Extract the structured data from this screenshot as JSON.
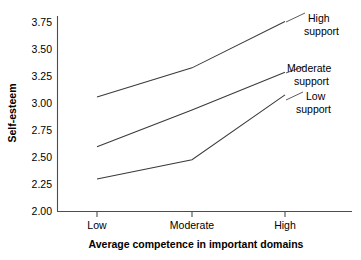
{
  "chart_data": {
    "type": "line",
    "title": "",
    "xlabel": "Average competence in important domains",
    "ylabel": "Self-esteem",
    "categories": [
      "Low",
      "Moderate",
      "High"
    ],
    "ylim": [
      2.0,
      3.8
    ],
    "yticks": [
      "2.00",
      "2.25",
      "2.50",
      "2.75",
      "3.00",
      "3.25",
      "3.50",
      "3.75"
    ],
    "ytick_values": [
      2.0,
      2.25,
      2.5,
      2.75,
      3.0,
      3.25,
      3.5,
      3.75
    ],
    "grid": false,
    "legend_position": "inline-right-annotations",
    "series": [
      {
        "name": "High support",
        "values": [
          3.06,
          3.33,
          3.76
        ]
      },
      {
        "name": "Moderate support",
        "values": [
          2.6,
          2.94,
          3.29
        ]
      },
      {
        "name": "Low support",
        "values": [
          2.3,
          2.48,
          3.08
        ]
      }
    ]
  },
  "axes": {
    "y_label": "Self-esteem",
    "x_label": "Average competence in important domains",
    "y_ticks": {
      "t0": "2.00",
      "t1": "2.25",
      "t2": "2.50",
      "t3": "2.75",
      "t4": "3.00",
      "t5": "3.25",
      "t6": "3.50",
      "t7": "3.75"
    },
    "x_ticks": {
      "c0": "Low",
      "c1": "Moderate",
      "c2": "High"
    }
  },
  "annotations": {
    "high": {
      "line1": "High",
      "line2": "support"
    },
    "moderate": {
      "line1": "Moderate",
      "line2": "support"
    },
    "low": {
      "line1": "Low",
      "line2": "support"
    }
  }
}
